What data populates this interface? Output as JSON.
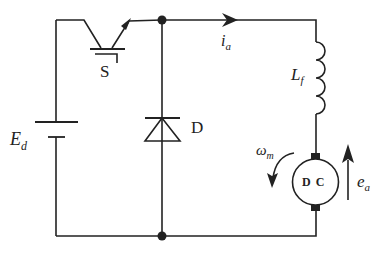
{
  "diagram": {
    "type": "circuit",
    "title": "",
    "components": {
      "switch": {
        "label": "S",
        "kind": "IGBT"
      },
      "diode": {
        "label": "D"
      },
      "source": {
        "label_main": "E",
        "label_sub": "d",
        "kind": "DC voltage source"
      },
      "inductor": {
        "label_main": "L",
        "label_sub": "f"
      },
      "motor": {
        "label": "D C",
        "kind": "DC motor"
      }
    },
    "signals": {
      "current": {
        "label_main": "i",
        "label_sub": "a",
        "direction": "right"
      },
      "speed": {
        "label_main": "ω",
        "label_sub": "m",
        "direction": "counter-clockwise"
      },
      "emf": {
        "label_main": "e",
        "label_sub": "a",
        "direction": "up"
      }
    },
    "colors": {
      "line": "#222222",
      "background": "#ffffff"
    }
  }
}
